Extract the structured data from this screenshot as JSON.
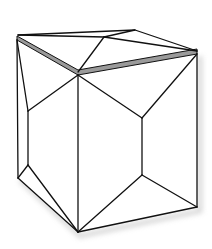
{
  "figure": {
    "colors": {
      "background": "#ffffff",
      "stroke": "#111111",
      "top_band": "#9a9a9a",
      "shadow": "#d0d0d0"
    }
  }
}
